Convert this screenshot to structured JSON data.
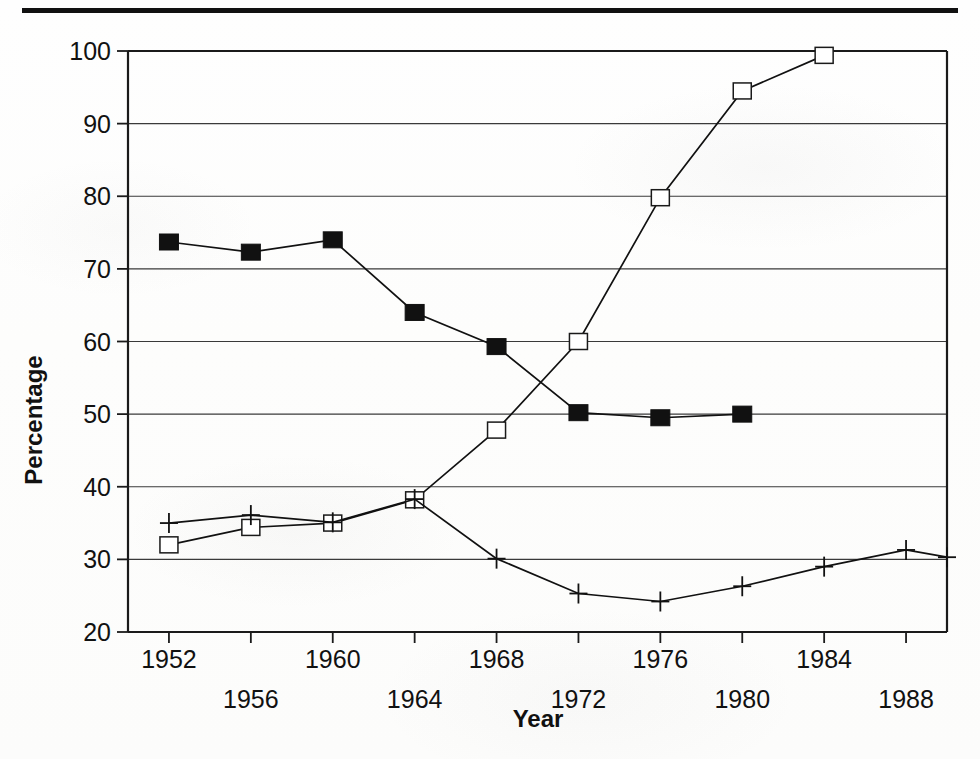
{
  "chart_data": {
    "type": "line",
    "title": "",
    "xlabel": "Year",
    "ylabel": "Percentage",
    "xlim": [
      1950,
      1990
    ],
    "ylim": [
      20,
      100
    ],
    "yticks": [
      20,
      30,
      40,
      50,
      60,
      70,
      80,
      90,
      100
    ],
    "xticks": [
      1952,
      1956,
      1960,
      1964,
      1968,
      1972,
      1976,
      1980,
      1984,
      1988
    ],
    "xtick_labels_row1": [
      "1952",
      "1960",
      "1968",
      "1976",
      "1984"
    ],
    "xtick_labels_row2": [
      "1956",
      "1964",
      "1972",
      "1980",
      "1988"
    ],
    "grid": "horizontal",
    "legend": "none",
    "series": [
      {
        "name": "series-filled-square",
        "marker": "filled-square",
        "x": [
          1952,
          1956,
          1960,
          1964,
          1968,
          1972,
          1976,
          1980
        ],
        "values": [
          73.7,
          72.3,
          74.0,
          64.0,
          59.3,
          50.2,
          49.5,
          50.0
        ]
      },
      {
        "name": "series-open-square",
        "marker": "open-square",
        "x": [
          1952,
          1956,
          1960,
          1964,
          1968,
          1972,
          1976,
          1980,
          1984
        ],
        "values": [
          32.0,
          34.4,
          35.0,
          38.2,
          47.8,
          60.0,
          79.8,
          94.5,
          99.4
        ]
      },
      {
        "name": "series-plus",
        "marker": "plus",
        "x": [
          1952,
          1956,
          1960,
          1964,
          1968,
          1972,
          1976,
          1980,
          1984,
          1988,
          1990
        ],
        "values": [
          35.0,
          36.1,
          35.1,
          38.3,
          30.1,
          25.3,
          24.2,
          26.3,
          29.0,
          31.3,
          30.3
        ]
      }
    ]
  },
  "axes": {
    "y_tick_labels": [
      "100",
      "90",
      "80",
      "70",
      "60",
      "50",
      "40",
      "30",
      "20"
    ],
    "y_axis_title": "Percentage",
    "x_axis_title": "Year"
  },
  "colors": {
    "ink": "#111111",
    "grid": "#3a3a3a",
    "paper": "#fefefe"
  }
}
